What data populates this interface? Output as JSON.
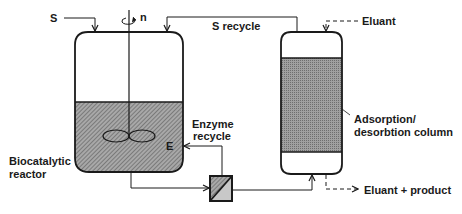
{
  "diagram": {
    "type": "process flow diagram",
    "labels": {
      "substrate_feed": "S",
      "stirrer_speed": "n",
      "substrate_recycle": "S recycle",
      "eluant_in": "Eluant",
      "enzyme": "E",
      "enzyme_recycle_line1": "Enzyme",
      "enzyme_recycle_line2": "recycle",
      "reactor_line1": "Biocatalytic",
      "reactor_line2": "reactor",
      "column_line1": "Adsorption/",
      "column_line2": "desorbtion column",
      "eluant_out": "Eluant + product"
    },
    "components": [
      {
        "id": "biocatalytic-reactor",
        "kind": "stirred tank reactor"
      },
      {
        "id": "membrane-filter",
        "kind": "membrane separation unit"
      },
      {
        "id": "adsorption-column",
        "kind": "packed adsorption/desorption column"
      }
    ],
    "colors": {
      "line": "#1a1a1a",
      "fill_reactor": "#8c8c8c",
      "fill_column": "#9a9a9a",
      "fill_filter_light": "#c8c8c8",
      "background": "#ffffff"
    }
  }
}
